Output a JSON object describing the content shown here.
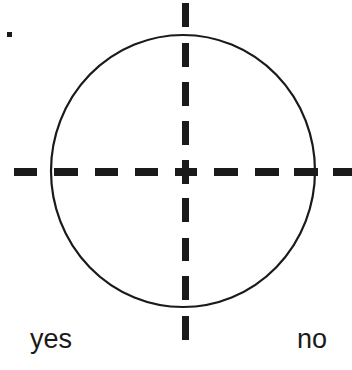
{
  "diagram": {
    "labels": {
      "left_bottom": "yes",
      "right_bottom": "no",
      "top_left_mark": "."
    },
    "shapes": {
      "circle": {
        "cx": 183,
        "cy": 171,
        "rx": 132,
        "ry": 136,
        "stroke": "#1a1a1a"
      },
      "vertical_axis": {
        "style": "dashed",
        "x": 185
      },
      "horizontal_axis": {
        "style": "dashed",
        "y": 171
      }
    }
  }
}
